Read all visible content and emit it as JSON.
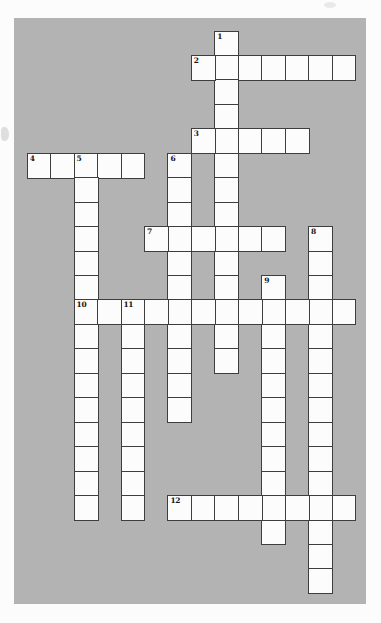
{
  "page": {
    "background": "#fcfcfc"
  },
  "puzzle": {
    "type": "crossword",
    "panel_background": "#b3b3b3",
    "cell_fill": "#fcfcfc",
    "line_color": "#3e3e3e",
    "number_color": "#151515",
    "grid_cols": 14,
    "grid_rows": 23,
    "cells_filled": "none",
    "words": [
      {
        "number": "1",
        "direction": "down",
        "col": 8,
        "row": 0,
        "length": 14
      },
      {
        "number": "2",
        "direction": "across",
        "col": 7,
        "row": 1,
        "length": 7
      },
      {
        "number": "3",
        "direction": "across",
        "col": 7,
        "row": 4,
        "length": 5
      },
      {
        "number": "4",
        "direction": "across",
        "col": 0,
        "row": 5,
        "length": 5
      },
      {
        "number": "5",
        "direction": "down",
        "col": 2,
        "row": 5,
        "length": 15
      },
      {
        "number": "6",
        "direction": "down",
        "col": 6,
        "row": 5,
        "length": 11
      },
      {
        "number": "7",
        "direction": "across",
        "col": 5,
        "row": 8,
        "length": 6
      },
      {
        "number": "8",
        "direction": "down",
        "col": 12,
        "row": 8,
        "length": 15
      },
      {
        "number": "9",
        "direction": "down",
        "col": 10,
        "row": 10,
        "length": 11
      },
      {
        "number": "10",
        "direction": "across",
        "col": 2,
        "row": 11,
        "length": 12
      },
      {
        "number": "11",
        "direction": "down",
        "col": 4,
        "row": 11,
        "length": 9
      },
      {
        "number": "12",
        "direction": "across",
        "col": 6,
        "row": 19,
        "length": 8
      }
    ]
  }
}
